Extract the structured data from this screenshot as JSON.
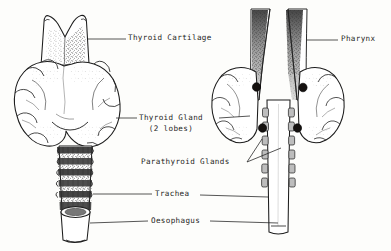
{
  "figure": {
    "ink_color": "#1d1d1d",
    "paper_color": "#fdfdfb",
    "views": [
      {
        "name": "anterior",
        "side": "left"
      },
      {
        "name": "posterior",
        "side": "right"
      }
    ]
  },
  "labels": {
    "thyroid_cartilage": "Thyroid Cartilage",
    "thyroid_gland": "Thyroid Gland",
    "thyroid_gland_sub": "(2 lobes)",
    "parathyroid_glands": "Parathyroid Glands",
    "trachea": "Trachea",
    "oesophagus": "Oesophagus",
    "pharynx": "Pharynx"
  },
  "structures": {
    "parathyroid_count": 4,
    "thyroid_lobe_count": 2,
    "parathyroid_fill": "#15110f"
  }
}
